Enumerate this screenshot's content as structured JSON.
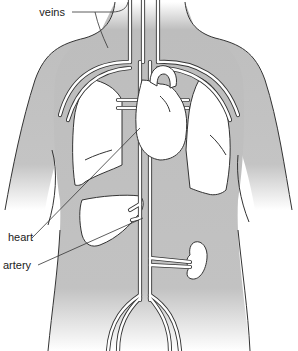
{
  "diagram": {
    "type": "anatomy-illustration",
    "labels": {
      "veins": "veins",
      "heart": "heart",
      "artery": "artery"
    },
    "colors": {
      "body_fill": "#bdbdbd",
      "organ_fill": "#ffffff",
      "outline": "#333333",
      "background": "#ffffff"
    },
    "organs": [
      "heart",
      "lungs",
      "liver",
      "kidney",
      "aorta",
      "vena cava",
      "iliac vessels"
    ]
  }
}
